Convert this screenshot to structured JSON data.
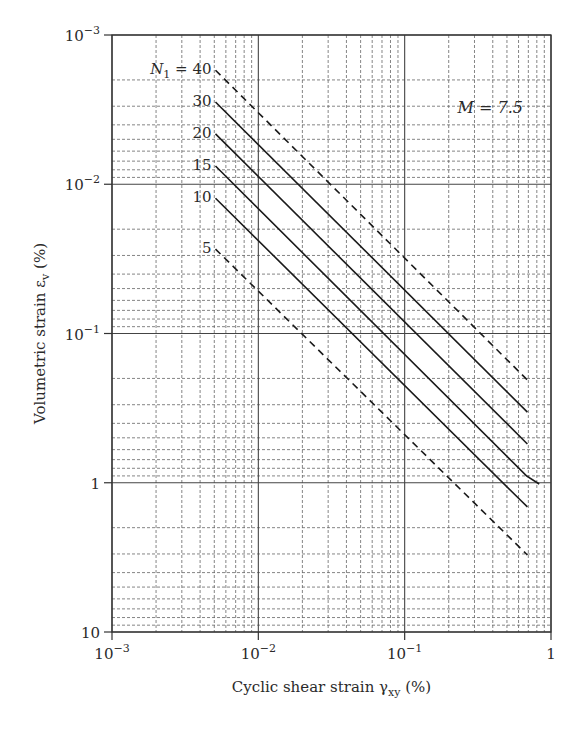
{
  "chart_data": {
    "type": "line",
    "title": "",
    "xlabel": "Cyclic shear strain γxy (%)",
    "ylabel": "Volumetric strain εv (%)",
    "x_scale": "log",
    "y_scale": "log",
    "y_inverted": true,
    "xlim": [
      0.001,
      1
    ],
    "ylim": [
      0.001,
      10
    ],
    "x_ticks": [
      {
        "value": 0.001,
        "base": "10",
        "exp": "−3"
      },
      {
        "value": 0.01,
        "base": "10",
        "exp": "−2"
      },
      {
        "value": 0.1,
        "base": "10",
        "exp": "−1"
      },
      {
        "value": 1,
        "base": "1",
        "exp": ""
      }
    ],
    "y_ticks": [
      {
        "value": 0.001,
        "base": "10",
        "exp": "−3"
      },
      {
        "value": 0.01,
        "base": "10",
        "exp": "−2"
      },
      {
        "value": 0.1,
        "base": "10",
        "exp": "−1"
      },
      {
        "value": 1,
        "base": "1",
        "exp": ""
      },
      {
        "value": 10,
        "base": "10",
        "exp": ""
      }
    ],
    "grid": {
      "major": "solid",
      "minor": "dashed"
    },
    "annotation": "M = 7.5",
    "series_label_prefix": "N1 =",
    "series": [
      {
        "name": "40",
        "label": "N1 = 40",
        "style": "dashed",
        "points": [
          [
            0.0051,
            0.00172
          ],
          [
            0.69,
            0.205
          ]
        ]
      },
      {
        "name": "30",
        "label": "30",
        "style": "solid",
        "points": [
          [
            0.0051,
            0.00281
          ],
          [
            0.69,
            0.336
          ]
        ]
      },
      {
        "name": "20",
        "label": "20",
        "style": "solid",
        "points": [
          [
            0.0051,
            0.0046
          ],
          [
            0.69,
            0.55
          ]
        ]
      },
      {
        "name": "15",
        "label": "15",
        "style": "solid",
        "points": [
          [
            0.0051,
            0.00755
          ],
          [
            0.68,
            0.9
          ],
          [
            0.83,
            1.02
          ]
        ]
      },
      {
        "name": "10",
        "label": "10",
        "style": "solid",
        "points": [
          [
            0.0051,
            0.0124
          ],
          [
            0.62,
            1.31
          ],
          [
            0.69,
            1.45
          ]
        ]
      },
      {
        "name": "5",
        "label": "5",
        "style": "dashed",
        "points": [
          [
            0.0051,
            0.0272
          ],
          [
            0.69,
            3.05
          ]
        ]
      }
    ]
  }
}
